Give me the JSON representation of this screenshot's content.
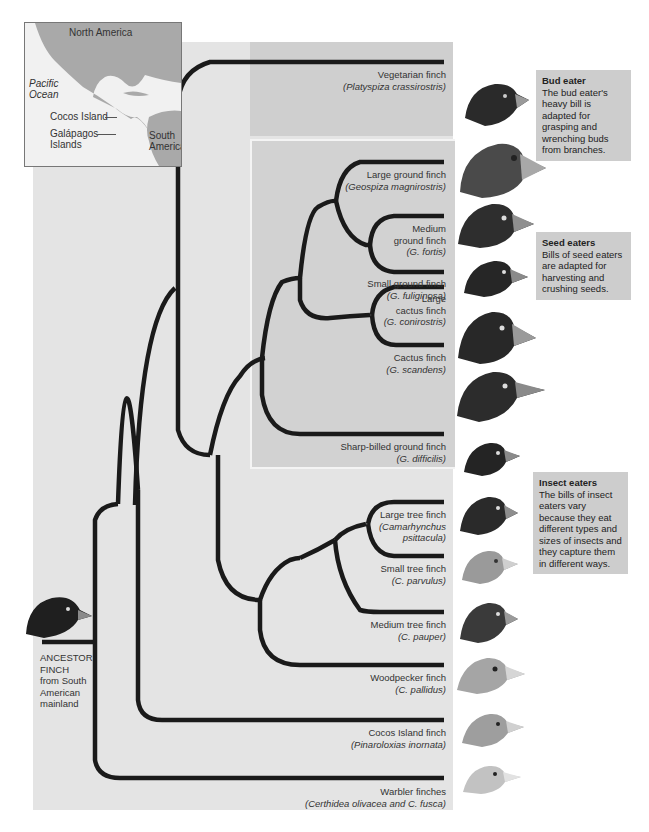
{
  "figure": {
    "ancestor_label": [
      "ANCESTOR",
      "FINCH",
      "from South",
      "American",
      "mainland"
    ]
  },
  "map": {
    "labels": {
      "north_america": "North America",
      "pacific_ocean_1": "Pacific",
      "pacific_ocean_2": "Ocean",
      "cocos_island": "Cocos Island",
      "galapagos_1": "Galápagos",
      "galapagos_2": "Islands",
      "south_america_1": "South",
      "south_america_2": "America"
    }
  },
  "species": [
    {
      "common": "Vegetarian finch",
      "scientific": "(Platyspiza crassirostris)",
      "group": "bud"
    },
    {
      "common": "Large ground finch",
      "scientific": "(Geospiza magnirostris)",
      "group": "seed"
    },
    {
      "common_lines": [
        "Medium",
        "ground finch"
      ],
      "scientific": "(G. fortis)",
      "group": "seed"
    },
    {
      "common": "Small ground finch",
      "scientific": "(G. fuliginosa)",
      "group": "seed"
    },
    {
      "common_lines": [
        "Large",
        "cactus finch"
      ],
      "scientific": "(G. conirostris)",
      "group": "seed"
    },
    {
      "common": "Cactus finch",
      "scientific": "(G. scandens)",
      "group": "seed"
    },
    {
      "common": "Sharp-billed ground finch",
      "scientific": "(G. difficilis)",
      "group": "seed"
    },
    {
      "common": "Large tree finch",
      "scientific_lines": [
        "(Camarhynchus",
        "psittacula)"
      ],
      "group": "insect"
    },
    {
      "common": "Small tree finch",
      "scientific": "(C. parvulus)",
      "group": "insect"
    },
    {
      "common": "Medium tree finch",
      "scientific": "(C. pauper)",
      "group": "insect"
    },
    {
      "common": "Woodpecker finch",
      "scientific": "(C. pallidus)",
      "group": "insect"
    },
    {
      "common": "Cocos Island finch",
      "scientific": "(Pinaroloxias inornata)",
      "group": "insect"
    },
    {
      "common": "Warbler finches",
      "scientific": "(Certhidea olivacea and C. fusca)",
      "group": "insect"
    }
  ],
  "callouts": {
    "bud": {
      "title": "Bud eater",
      "text": "The bud eater's heavy bill is adapted for grasping and wrenching buds from branches."
    },
    "seed": {
      "title": "Seed eaters",
      "text": "Bills of seed eaters are adapted for harvesting and crushing seeds."
    },
    "insect": {
      "title": "Insect eaters",
      "text": "The bills of insect eaters vary because they eat different types and sizes of insects and they capture them in different ways."
    }
  },
  "colors": {
    "background": "#e4e4e4",
    "bud_region": "#cfcfcf",
    "seed_region": "#d2d2d2",
    "callout": "#cdcdcd",
    "branch": "#1a1a1a",
    "land": "#a9a9a9"
  }
}
